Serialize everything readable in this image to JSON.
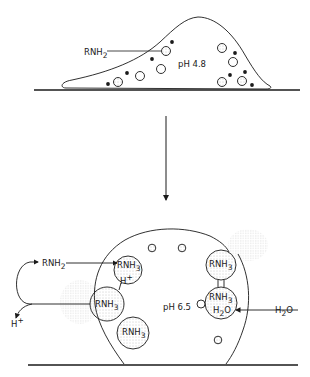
{
  "top_panel": {
    "label_amine": "RNH",
    "label_amine_sub": "2",
    "label_ph": "pH  4.8"
  },
  "bottom_panel": {
    "label_ph": "pH 6.5",
    "label_amine_in": "RNH",
    "label_amine_in_sub": "2",
    "label_proton_out": "H",
    "label_proton_out_sup": "+",
    "label_proton_in": "H",
    "label_proton_in_sup": "+",
    "vesicle_label": "RNH",
    "vesicle_label_sub": "3",
    "vesicle_label_sup": "+",
    "water_out": "H",
    "water_out_sub": "2",
    "water_out_o": "O",
    "water_in": "H",
    "water_in_sub": "2",
    "water_in_o": "O"
  },
  "colors": {
    "ink": "#1a1a1a",
    "background": "#ffffff",
    "stipple": "#9a9a9a"
  }
}
